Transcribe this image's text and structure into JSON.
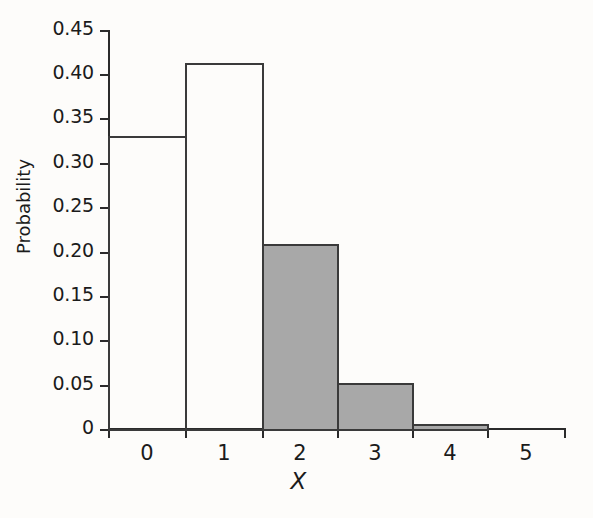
{
  "chart_data": {
    "type": "bar",
    "title": "",
    "subtitle": "",
    "xlabel": "X",
    "ylabel": "Probability",
    "categories": [
      "0",
      "1",
      "2",
      "3",
      "4",
      "5"
    ],
    "values": [
      0.331,
      0.413,
      0.209,
      0.052,
      0.006,
      0
    ],
    "bar_styles": [
      "open",
      "open",
      "filled",
      "filled",
      "filled",
      "none"
    ],
    "xlim": [
      -0.5,
      5.5
    ],
    "ylim": [
      0,
      0.45
    ],
    "ytick_values": [
      0,
      0.05,
      0.1,
      0.15,
      0.2,
      0.25,
      0.3,
      0.35,
      0.4,
      0.45
    ],
    "ytick_labels": [
      "0",
      "0.05",
      "0.10",
      "0.15",
      "0.20",
      "0.25",
      "0.30",
      "0.35",
      "0.40",
      "0.45"
    ],
    "xtick_labels": [
      "0",
      "1",
      "2",
      "3",
      "4",
      "5"
    ],
    "grid": false,
    "legend": null,
    "annotations": [],
    "colors": {
      "fill_gray": "#a8a8a8",
      "outline": "#3a3a3a",
      "axis": "#2b2b2b",
      "text": "#1b1b1b",
      "background": "#fdfcfa"
    }
  },
  "axis": {
    "y_title": "Probability",
    "x_title": "X",
    "y_labels": {
      "t0": "0",
      "t1": "0.05",
      "t2": "0.10",
      "t3": "0.15",
      "t4": "0.20",
      "t5": "0.25",
      "t6": "0.30",
      "t7": "0.35",
      "t8": "0.40",
      "t9": "0.45"
    },
    "x_labels": {
      "c0": "0",
      "c1": "1",
      "c2": "2",
      "c3": "3",
      "c4": "4",
      "c5": "5"
    }
  }
}
